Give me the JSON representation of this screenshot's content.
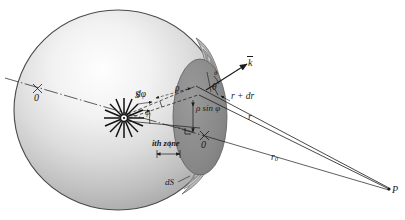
{
  "figure": {
    "type": "optics-diagram",
    "background_color": "#ffffff",
    "ink_color": "#1a1a1a"
  },
  "colors": {
    "sphere_light": "#fdfdfd",
    "sphere_mid": "#c9c9c9",
    "sphere_dark": "#9a9a9a",
    "sphere_outline": "#4a4a4a",
    "zone_dark": "#8e8e8e",
    "zone_mid": "#a8a8a8",
    "zone_light": "#cfcfcf",
    "cap_fill": "#8a8a8a"
  },
  "labels": {
    "o_prime": "0",
    "source": "S",
    "d_phi": "dφ",
    "phi": "φ",
    "rho": "ρ",
    "k_vector": "k",
    "theta": "θ",
    "theta_small": "θ",
    "r_plus_dr": "r + dr",
    "r": "r",
    "rho_sin_phi": "ρ sin φ",
    "origin": "0",
    "ith_zone": "ith zone",
    "dS": "dS",
    "r_zero_base": "r",
    "r_zero_sub": "0",
    "point_p": "P"
  }
}
